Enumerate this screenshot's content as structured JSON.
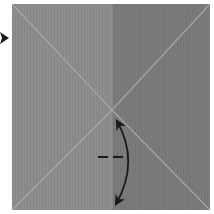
{
  "diagram": {
    "type": "origami-step",
    "paper": {
      "x": 12,
      "y": 4,
      "width": 198,
      "height": 206,
      "left_half_color": "#8c8c8c",
      "right_half_color": "#7a7a7a",
      "crease_color": "#a9a9a9",
      "center_fold_x": 112
    },
    "creases": [
      {
        "name": "diagonal-top-left",
        "x1": 12,
        "y1": 4,
        "x2": 112,
        "y2": 110
      },
      {
        "name": "diagonal-top-right",
        "x1": 210,
        "y1": 4,
        "x2": 112,
        "y2": 110
      },
      {
        "name": "diagonal-bottom-left",
        "x1": 12,
        "y1": 210,
        "x2": 112,
        "y2": 110
      },
      {
        "name": "diagonal-bottom-right",
        "x1": 210,
        "y1": 210,
        "x2": 112,
        "y2": 110
      }
    ],
    "symbols": {
      "side_arrow": {
        "meaning": "turn-over / direction indicator",
        "x": 0,
        "y": 38
      },
      "dashed_line": {
        "meaning": "valley fold line",
        "x1": 98,
        "y1": 157,
        "x2": 125,
        "y2": 157
      },
      "curved_arrow": {
        "meaning": "fold and unfold",
        "start": [
          117,
          120
        ],
        "end": [
          116,
          204
        ]
      }
    },
    "ink_color": "#1a1a1a"
  }
}
